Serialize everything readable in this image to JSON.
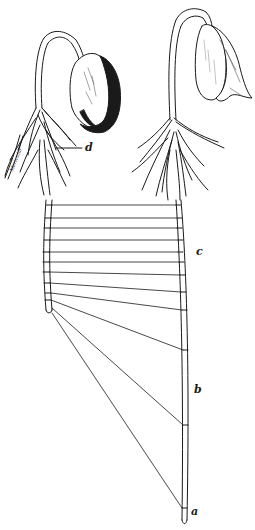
{
  "figure": {
    "ink_color": "#1a1a1a",
    "background_color": "#ffffff"
  },
  "labels": {
    "a": "a",
    "b": "b",
    "c": "c",
    "d": "d"
  },
  "signature": "Mericular",
  "seedlings": [
    {
      "name": "left-seedling",
      "seed_shading": "dark"
    },
    {
      "name": "right-seedling",
      "seed_shading": "light"
    }
  ],
  "connector_lines": {
    "count": 13,
    "left_root_marks_y": [
      205,
      218,
      228,
      240,
      252,
      262,
      272,
      283,
      293,
      300,
      308,
      316
    ],
    "right_root_marks_y": [
      205,
      218,
      228,
      240,
      252,
      262,
      275,
      292,
      310,
      350,
      425,
      508
    ]
  }
}
